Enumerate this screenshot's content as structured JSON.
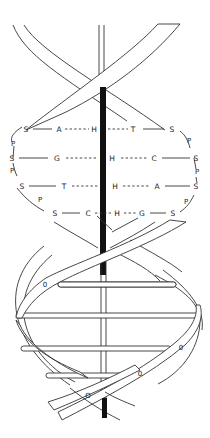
{
  "diagram": {
    "type": "dna-double-helix",
    "axis_color": "#111111",
    "line_color": "#333333",
    "background": "#ffffff",
    "base_pair_rows": [
      {
        "left_sugar": "S",
        "left_base": "A",
        "bond": "H",
        "right_base": "T",
        "right_sugar": "S"
      },
      {
        "left_sugar": "S",
        "left_base": "G",
        "bond": "H",
        "right_base": "C",
        "right_sugar": "S"
      },
      {
        "left_sugar": "S",
        "left_base": "T",
        "bond": "H",
        "right_base": "A",
        "right_sugar": "S"
      },
      {
        "left_sugar": "S",
        "left_base": "C",
        "bond": "H",
        "right_base": "G",
        "right_sugar": "S"
      }
    ],
    "backbone_left": [
      "P",
      "S",
      "P",
      "P"
    ],
    "backbone_right": [
      "P",
      "P",
      "S",
      "P"
    ],
    "phosphate_label": "P",
    "sugar_label": "S",
    "ribbon_markers": [
      "0",
      "0",
      "0",
      "O"
    ]
  }
}
